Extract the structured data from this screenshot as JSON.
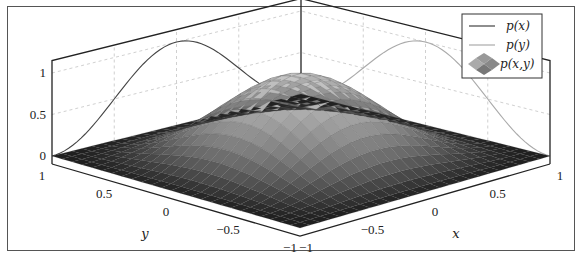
{
  "chart_data": {
    "type": "surface3d",
    "title": "",
    "function": "p(x,y) = p(x)*p(y), bell-shaped (cos^2-like) on [-1,1]x[-1,1]",
    "xlabel": "x",
    "ylabel": "y",
    "zlabel": "",
    "xlim": [
      -1,
      1
    ],
    "ylim": [
      -1,
      1
    ],
    "zlim": [
      0,
      1
    ],
    "x_ticks": [
      "−1",
      "−0.5",
      "0",
      "0.5",
      "1"
    ],
    "y_ticks": [
      "1",
      "0.5",
      "0",
      "−0.5",
      "−1"
    ],
    "z_ticks": [
      "0",
      "0.5",
      "1"
    ],
    "grid": true,
    "legend_position": "north east",
    "legend": [
      {
        "label": "p(x)",
        "style": "line",
        "color": "#444444"
      },
      {
        "label": "p(y)",
        "style": "line",
        "color": "#aaaaaa"
      },
      {
        "label": "p(x,y)",
        "style": "surface",
        "color": "#777777"
      }
    ],
    "series": [
      {
        "name": "p(x)",
        "x": [
          -1,
          -0.75,
          -0.5,
          -0.25,
          0,
          0.25,
          0.5,
          0.75,
          1
        ],
        "values": [
          0,
          0.15,
          0.5,
          0.85,
          1,
          0.85,
          0.5,
          0.15,
          0
        ]
      },
      {
        "name": "p(y)",
        "x": [
          -1,
          -0.75,
          -0.5,
          -0.25,
          0,
          0.25,
          0.5,
          0.75,
          1
        ],
        "values": [
          0,
          0.15,
          0.5,
          0.85,
          1,
          0.85,
          0.5,
          0.15,
          0
        ]
      },
      {
        "name": "p(x,y)",
        "peak": 1,
        "peak_at": [
          0,
          0
        ],
        "grid_resolution": 25
      }
    ]
  },
  "colors": {
    "px_line": "#444444",
    "py_line": "#aaaaaa",
    "surface_low": "#1e1e1e",
    "surface_high": "#c8c8c8",
    "axis": "#222222",
    "grid": "#bbbbbb"
  }
}
